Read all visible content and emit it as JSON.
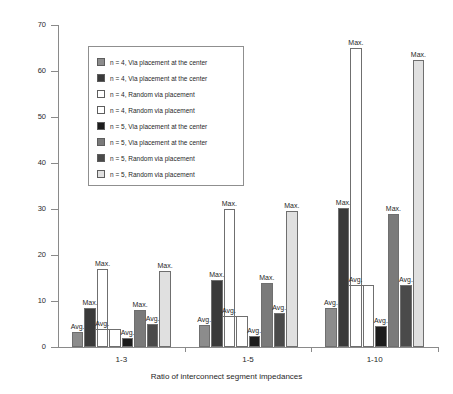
{
  "chart_data": {
    "type": "bar",
    "title": "",
    "xlabel": "Ratio of interconnect segment impedances",
    "ylabel": "Improvement in delay [%]",
    "categories": [
      "1-3",
      "1-5",
      "1-10"
    ],
    "ylim": [
      0,
      70
    ],
    "yticks": [
      0,
      10,
      20,
      30,
      40,
      50,
      60,
      70
    ],
    "ytick_labels": [
      "0",
      "10",
      "20",
      "30",
      "40",
      "50",
      "60",
      "70"
    ],
    "grid": false,
    "legend_position": "upper-left-inside",
    "series": [
      {
        "name": "n = 4, Via placement at the center",
        "statistic": "Avg.",
        "color": "#8c8c8c",
        "values": [
          3.2,
          4.8,
          8.5
        ]
      },
      {
        "name": "n = 4, Via placement at the center",
        "statistic": "Max.",
        "color": "#3a3a3a",
        "values": [
          8.5,
          14.5,
          30.2
        ]
      },
      {
        "name": "n = 4, Random via placement",
        "statistic": "Max.",
        "color": "#ffffff",
        "values": [
          17.0,
          30.0,
          65.0
        ]
      },
      {
        "name": "n = 4, Random via placement",
        "statistic": "Avg.",
        "color": "#ffffff",
        "values": [
          4.0,
          6.8,
          13.5
        ]
      },
      {
        "name": "n = 5, Via placement at the center",
        "statistic": "Avg.",
        "color": "#1c1c1c",
        "values": [
          2.0,
          2.5,
          4.5
        ]
      },
      {
        "name": "n = 5, Via placement at the center",
        "statistic": "Max.",
        "color": "#7a7a7a",
        "values": [
          8.0,
          14.0,
          29.0
        ]
      },
      {
        "name": "n = 5, Random via placement",
        "statistic": "Avg.",
        "color": "#4a4a4a",
        "values": [
          5.0,
          7.5,
          13.5
        ]
      },
      {
        "name": "n = 5, Random via placement",
        "statistic": "Max.",
        "color": "#e0e0e0",
        "values": [
          16.5,
          29.5,
          62.5
        ]
      }
    ],
    "annotations": {
      "avg_label": "Avg.",
      "max_label": "Max."
    }
  },
  "legend": {
    "items": [
      {
        "label": "n = 4, Via placement at the center",
        "swatch": "#8c8c8c"
      },
      {
        "label": "n = 4, Via placement at the center",
        "swatch": "#3a3a3a"
      },
      {
        "label": "n = 4, Random via placement",
        "swatch": "#ffffff"
      },
      {
        "label": "n = 4, Random via placement",
        "swatch": "#ffffff"
      },
      {
        "label": "n = 5, Via placement at the center",
        "swatch": "#1c1c1c"
      },
      {
        "label": "n = 5, Via placement at the center",
        "swatch": "#7a7a7a"
      },
      {
        "label": "n = 5, Random via placement",
        "swatch": "#4a4a4a"
      },
      {
        "label": "n = 5, Random via placement",
        "swatch": "#e0e0e0"
      }
    ]
  }
}
